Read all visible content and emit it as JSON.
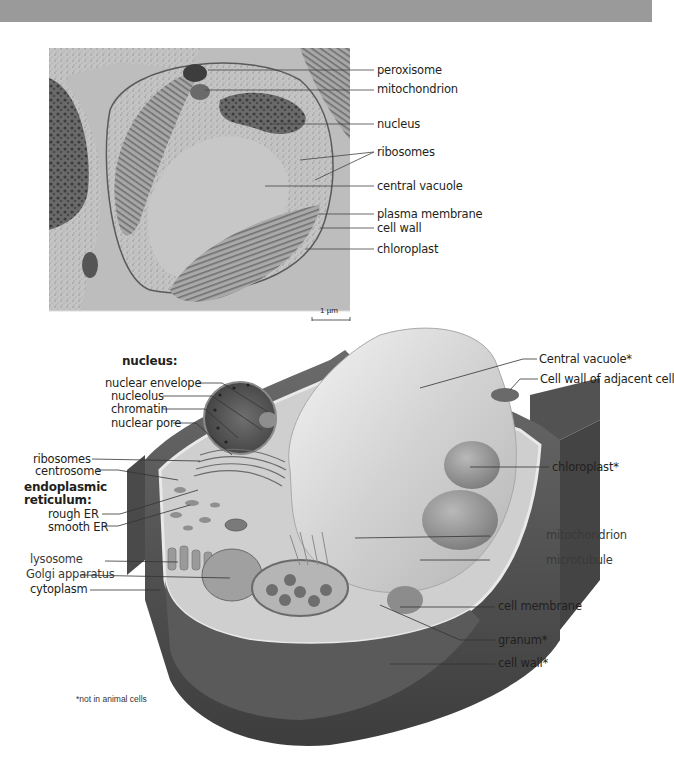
{
  "header": {
    "bar_color": "#9a9a9a"
  },
  "micrograph": {
    "scale_bar": "1 µm",
    "labels": [
      {
        "id": "peroxisome",
        "text": "peroxisome"
      },
      {
        "id": "mitochondrion",
        "text": "mitochondrion"
      },
      {
        "id": "nucleus",
        "text": "nucleus"
      },
      {
        "id": "ribosomes",
        "text": "ribosomes"
      },
      {
        "id": "central-vacuole",
        "text": "central vacuole"
      },
      {
        "id": "plasma-membrane",
        "text": "plasma membrane"
      },
      {
        "id": "cell-wall",
        "text": "cell wall"
      },
      {
        "id": "chloroplast",
        "text": "chloroplast"
      }
    ]
  },
  "diagram": {
    "nucleus_heading": "nucleus:",
    "er_heading_line1": "endoplasmic",
    "er_heading_line2": "reticulum:",
    "left_labels": {
      "nuclear_envelope": "nuclear envelope",
      "nucleolus": "nucleolus",
      "chromatin": "chromatin",
      "nuclear_pore": "nuclear pore",
      "ribosomes": "ribosomes",
      "centrosome": "centrosome",
      "rough_er": "rough ER",
      "smooth_er": "smooth ER",
      "lysosome": "lysosome",
      "golgi": "Golgi apparatus",
      "cytoplasm": "cytoplasm"
    },
    "right_labels": {
      "central_vacuole": "Central vacuole*",
      "cell_wall_adjacent": "Cell wall of adjacent cell",
      "chloroplast": "chloroplast*",
      "mitochondrion": "mitochondrion",
      "microtubule": "microtubule",
      "cell_membrane": "cell membrane",
      "granum": "granum*",
      "cell_wall": "cell wall*"
    },
    "footnote": "*not in animal cells"
  }
}
